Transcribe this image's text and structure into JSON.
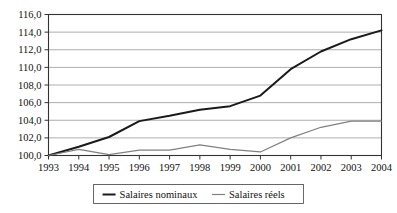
{
  "chart_data": {
    "type": "line",
    "title": "",
    "subtitle": "",
    "xlabel": "",
    "ylabel": "",
    "categories": [
      "1993",
      "1994",
      "1995",
      "1996",
      "1997",
      "1998",
      "1999",
      "2000",
      "2001",
      "2002",
      "2003",
      "2004"
    ],
    "x": [
      1993,
      1994,
      1995,
      1996,
      1997,
      1998,
      1999,
      2000,
      2001,
      2002,
      2003,
      2004
    ],
    "series": [
      {
        "name": "Salaires nominaux",
        "color": "#1a1a1a",
        "line_width": 2.0,
        "values": [
          100.0,
          101.0,
          102.1,
          103.9,
          104.5,
          105.2,
          105.6,
          106.8,
          109.8,
          111.8,
          113.2,
          114.2
        ]
      },
      {
        "name": "Salaires réels",
        "color": "#808080",
        "line_width": 1.2,
        "values": [
          100.0,
          100.7,
          100.1,
          100.6,
          100.6,
          101.2,
          100.7,
          100.4,
          102.0,
          103.2,
          103.9,
          103.9
        ]
      }
    ],
    "ylim": [
      100.0,
      116.0
    ],
    "ytick_step": 2.0,
    "ytick_labels": [
      "100,0",
      "102,0",
      "104,0",
      "106,0",
      "108,0",
      "110,0",
      "112,0",
      "114,0",
      "116,0"
    ],
    "ytick_values": [
      100.0,
      102.0,
      104.0,
      106.0,
      108.0,
      110.0,
      112.0,
      114.0,
      116.0
    ],
    "grid": {
      "horizontal": true,
      "vertical": false,
      "color": "#999999"
    },
    "legend": {
      "position": "bottom",
      "boxed": true,
      "entries": [
        {
          "label": "Salaires nominaux",
          "color": "#1a1a1a",
          "line_width": 2.0
        },
        {
          "label": "Salaires réels",
          "color": "#808080",
          "line_width": 1.2
        }
      ]
    },
    "axis": {
      "frame_color": "#333333",
      "tick_color": "#333333"
    }
  }
}
